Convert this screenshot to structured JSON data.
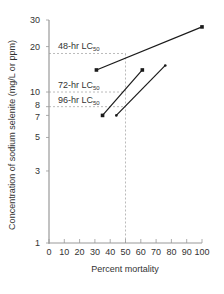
{
  "chart_data": {
    "type": "line",
    "title": "",
    "xlabel": "Percent mortality",
    "ylabel": "Concentration of sodium selenite (mg/L or ppm)",
    "xlim": [
      0,
      100
    ],
    "ylim": [
      1,
      30
    ],
    "yscale": "log",
    "x_ticks": [
      0,
      10,
      20,
      30,
      40,
      50,
      60,
      70,
      80,
      90,
      100
    ],
    "y_ticks": [
      1,
      3,
      5,
      7,
      8,
      10,
      20,
      30
    ],
    "grid": false,
    "series": [
      {
        "name": "48-hr",
        "x": [
          31,
          100
        ],
        "y": [
          14,
          27
        ],
        "marker": "square"
      },
      {
        "name": "72-hr",
        "x": [
          35,
          61
        ],
        "y": [
          7,
          14
        ],
        "marker": "square"
      },
      {
        "name": "96-hr",
        "x": [
          44,
          76
        ],
        "y": [
          7,
          15
        ],
        "marker": "small-dot"
      }
    ],
    "reference_lines": {
      "vertical_x": 50,
      "horizontal": [
        {
          "label_main": "48-hr LC",
          "label_sub": "50",
          "y": 18
        },
        {
          "label_main": "72-hr LC",
          "label_sub": "50",
          "y": 10
        },
        {
          "label_main": "96-hr LC",
          "label_sub": "50",
          "y": 8
        }
      ]
    },
    "colors": {
      "line": "#1a1a1a",
      "axis": "#999999",
      "reference": "#aaaaaa",
      "text": "#333333"
    }
  }
}
